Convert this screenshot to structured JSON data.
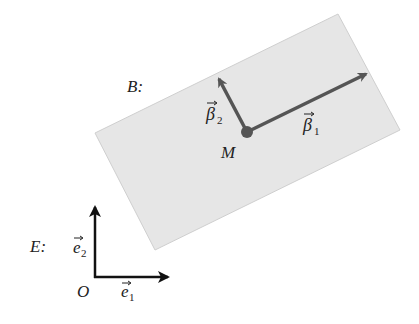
{
  "diagram": {
    "body_frame": {
      "label": "B:",
      "point_label": "M",
      "vector1": {
        "symbol": "β",
        "subscript": "1"
      },
      "vector2": {
        "symbol": "β",
        "subscript": "2"
      },
      "fill_color": "#e6e6e6",
      "vector_color": "#555555"
    },
    "earth_frame": {
      "label": "E:",
      "origin_label": "O",
      "vector1": {
        "symbol": "e",
        "subscript": "1"
      },
      "vector2": {
        "symbol": "e",
        "subscript": "2"
      },
      "vector_color": "#111111"
    }
  }
}
